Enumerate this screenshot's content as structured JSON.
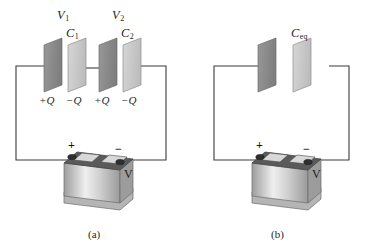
{
  "figure": {
    "background_color": "#ffffff",
    "wire_color": "#3b3b3b",
    "plate_dark_color": "#8c8c8c",
    "plate_light_color": "#c9c9c9",
    "plate_edge_color": "#5a5a5a",
    "battery_body_color": "#c4c4c4",
    "battery_top_color": "#4a4a4a"
  },
  "panel_a": {
    "caption": "(a)",
    "capacitors": [
      {
        "voltage_label": "V",
        "voltage_sub": "1",
        "name_label": "C",
        "name_sub": "1",
        "charge_positive": "+Q",
        "charge_negative": "−Q"
      },
      {
        "voltage_label": "V",
        "voltage_sub": "2",
        "name_label": "C",
        "name_sub": "2",
        "charge_positive": "+Q",
        "charge_negative": "−Q"
      }
    ],
    "battery": {
      "terminal_positive": "+",
      "terminal_negative": "−",
      "voltage_label": "V"
    }
  },
  "panel_b": {
    "caption": "(b)",
    "capacitor": {
      "name_label": "C",
      "name_sub": "eq"
    },
    "battery": {
      "terminal_positive": "+",
      "terminal_negative": "−",
      "voltage_label": "V"
    }
  }
}
